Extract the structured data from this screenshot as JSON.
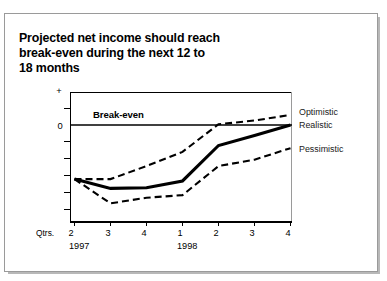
{
  "title": "Projected net income should reach\nbreak-even during the next 12 to\n18 months",
  "annotations": {
    "breakeven": "Break-even",
    "qtrs_label": "Qtrs."
  },
  "axis": {
    "y_top_symbol": "+",
    "y_zero_label": "0"
  },
  "series_labels": {
    "optimistic": "Optimistic",
    "realistic": "Realistic",
    "pessimistic": "Pessimistic"
  },
  "years": {
    "first": "1997",
    "second": "1998"
  },
  "quarters": [
    "2",
    "3",
    "4",
    "1",
    "2",
    "3",
    "4"
  ],
  "colors": {
    "line": "#000000",
    "frame": "#9a9a9a",
    "text": "#000000",
    "background": "#ffffff"
  },
  "chart_data": {
    "type": "line",
    "title": "Projected net income should reach break-even during the next 12 to 18 months",
    "xlabel": "Qtrs.",
    "ylabel": "",
    "x": [
      "2 1997",
      "3 1997",
      "4 1997",
      "1 1998",
      "2 1998",
      "3 1998",
      "4 1998"
    ],
    "categories": [
      "2",
      "3",
      "4",
      "1",
      "2",
      "3",
      "4"
    ],
    "grid": false,
    "legend_position": "right",
    "ylim": [
      -2.6,
      1.1
    ],
    "yticks": [
      1.0,
      0.5,
      0.0,
      -0.5,
      -1.0,
      -1.5,
      -2.0
    ],
    "ytick_labels": [
      "+",
      "",
      "0",
      "",
      "",
      "",
      ""
    ],
    "annotations": [
      {
        "text": "Break-even",
        "x": "2 1997",
        "y": 0.0,
        "note": "label above the zero reference line"
      }
    ],
    "reference_lines": [
      {
        "value": 0.0,
        "label": "Break-even",
        "style": "solid"
      }
    ],
    "series": [
      {
        "name": "Optimistic",
        "style": "dashed",
        "values": [
          -1.45,
          -1.45,
          -1.1,
          -0.72,
          0.02,
          0.12,
          0.27
        ]
      },
      {
        "name": "Realistic",
        "style": "solid",
        "values": [
          -1.45,
          -1.7,
          -1.68,
          -1.5,
          -0.55,
          -0.28,
          0.0
        ]
      },
      {
        "name": "Pessimistic",
        "style": "dashed",
        "values": [
          -1.45,
          -2.1,
          -1.95,
          -1.88,
          -1.1,
          -0.93,
          -0.62
        ]
      }
    ]
  }
}
